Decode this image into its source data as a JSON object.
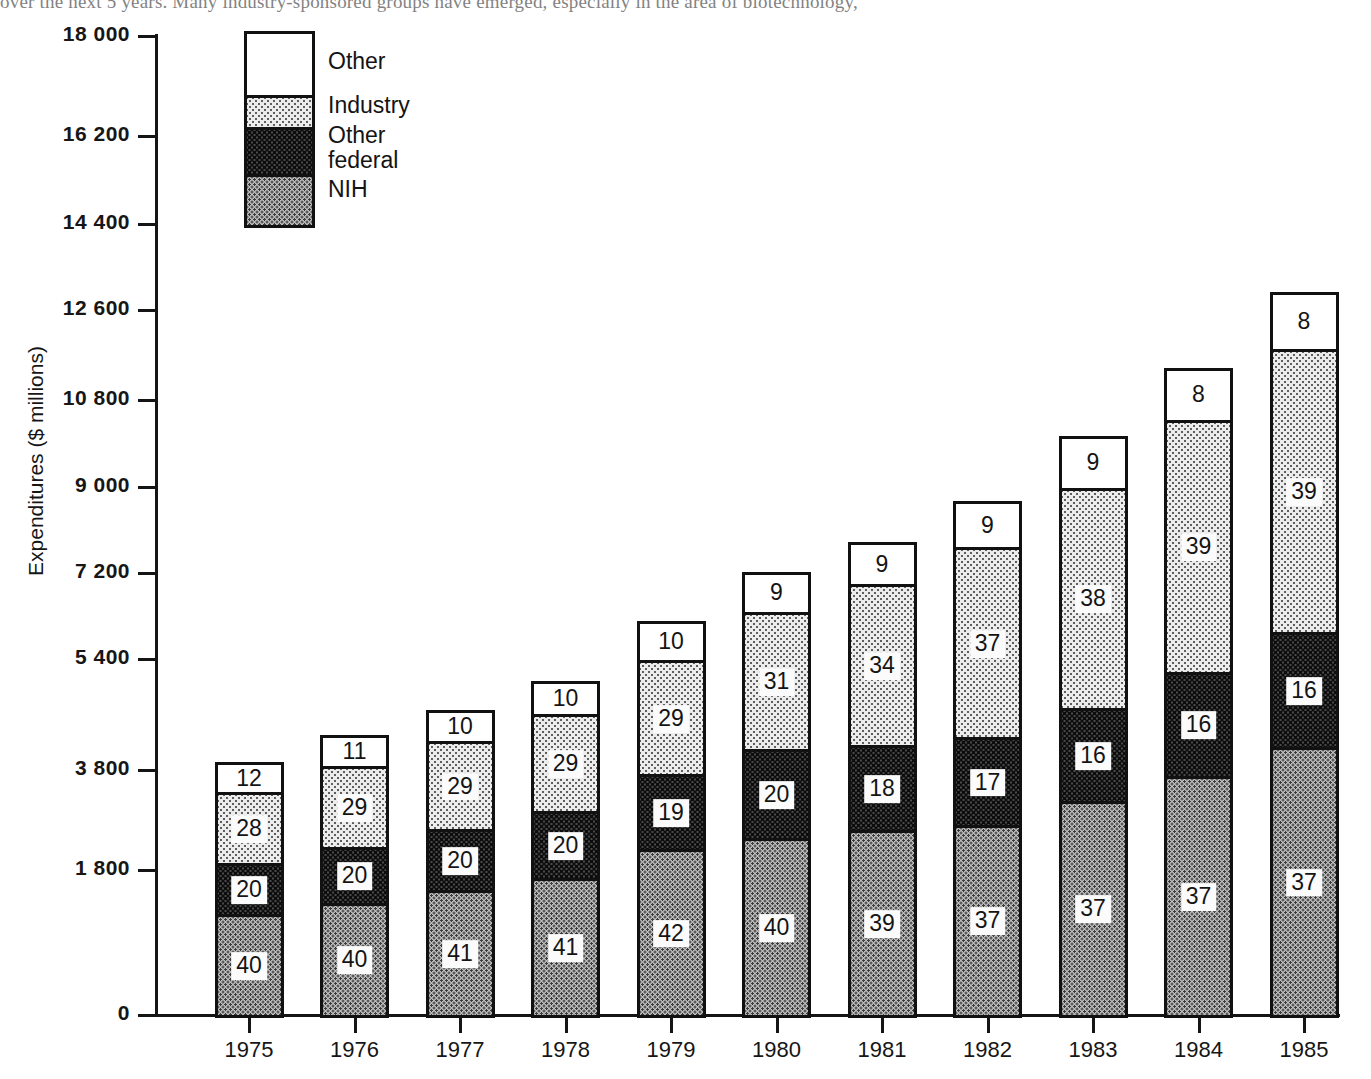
{
  "top_clipped_text": "over the next 5 years.  Many industry-sponsored groups have emerged, especially in the area of biotechnology,",
  "chart_data": {
    "type": "bar",
    "stacked": true,
    "title": "",
    "xlabel": "",
    "ylabel": "Expenditures ($ millions)",
    "categories": [
      "1975",
      "1976",
      "1977",
      "1978",
      "1979",
      "1980",
      "1981",
      "1982",
      "1983",
      "1984",
      "1985"
    ],
    "ylim": [
      0,
      18000
    ],
    "ytick_labels": [
      "0",
      "1 800",
      "3 800",
      "5 400",
      "7 200",
      "9 000",
      "10 800",
      "12 600",
      "14 400",
      "16 200",
      "18 000"
    ],
    "ytick_values": [
      0,
      1800,
      3600,
      5400,
      7200,
      9000,
      10800,
      12600,
      14400,
      16200,
      18000
    ],
    "grid": false,
    "legend_position": "top-left",
    "value_unit": "percent-of-total-share",
    "series": [
      {
        "name": "NIH",
        "fill": "nih",
        "values": [
          40,
          40,
          41,
          41,
          42,
          40,
          39,
          37,
          37,
          37,
          37
        ]
      },
      {
        "name": "Other federal",
        "fill": "otherfederal",
        "values": [
          20,
          20,
          20,
          20,
          19,
          20,
          18,
          17,
          16,
          16,
          16
        ]
      },
      {
        "name": "Industry",
        "fill": "industry",
        "values": [
          28,
          29,
          29,
          29,
          29,
          31,
          34,
          37,
          38,
          39,
          39
        ]
      },
      {
        "name": "Other",
        "fill": "other",
        "values": [
          12,
          11,
          10,
          10,
          10,
          9,
          9,
          9,
          9,
          8,
          8
        ]
      }
    ],
    "bar_totals": [
      4650,
      5150,
      5600,
      6150,
      7250,
      8150,
      8700,
      9450,
      10650,
      11900,
      13300
    ],
    "segment_totals": [
      {
        "year": "1975",
        "NIH": 1860,
        "Other federal": 930,
        "Industry": 1302,
        "Other": 558,
        "total": 4650
      },
      {
        "year": "1976",
        "NIH": 2060,
        "Other federal": 1030,
        "Industry": 1494,
        "Other": 566,
        "total": 5150
      },
      {
        "year": "1977",
        "NIH": 2296,
        "Other federal": 1120,
        "Industry": 1624,
        "Other": 560,
        "total": 5600
      },
      {
        "year": "1978",
        "NIH": 2522,
        "Other federal": 1230,
        "Industry": 1784,
        "Other": 615,
        "total": 6150
      },
      {
        "year": "1979",
        "NIH": 3045,
        "Other federal": 1378,
        "Industry": 2103,
        "Other": 725,
        "total": 7250
      },
      {
        "year": "1980",
        "NIH": 3260,
        "Other federal": 1630,
        "Industry": 2527,
        "Other": 734,
        "total": 8150
      },
      {
        "year": "1981",
        "NIH": 3393,
        "Other federal": 1566,
        "Industry": 2958,
        "Other": 783,
        "total": 8700
      },
      {
        "year": "1982",
        "NIH": 3497,
        "Other federal": 1607,
        "Industry": 3497,
        "Other": 851,
        "total": 9450
      },
      {
        "year": "1983",
        "NIH": 3941,
        "Other federal": 1704,
        "Industry": 4047,
        "Other": 959,
        "total": 10650
      },
      {
        "year": "1984",
        "NIH": 4403,
        "Other federal": 1904,
        "Industry": 4641,
        "Other": 952,
        "total": 11900
      },
      {
        "year": "1985",
        "NIH": 4921,
        "Other federal": 2128,
        "Industry": 5187,
        "Other": 1064,
        "total": 13300
      }
    ]
  },
  "legend": {
    "items": [
      {
        "label": "Other",
        "fill": "other"
      },
      {
        "label": "Industry",
        "fill": "industry"
      },
      {
        "label": "Other\nfederal",
        "fill": "otherfederal"
      },
      {
        "label": "NIH",
        "fill": "nih"
      }
    ]
  },
  "colors": {
    "axis": "#151515",
    "outline": "#111111",
    "other": "#ffffff",
    "industry": "#ececec",
    "other_federal": "#4a4a4a",
    "nih": "#bdbdbd"
  }
}
